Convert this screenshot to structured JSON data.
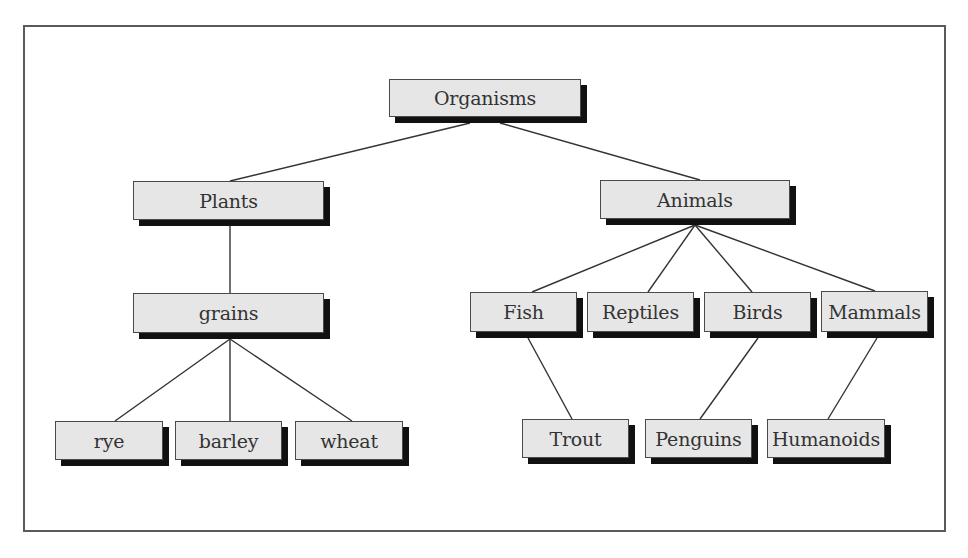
{
  "diagram": {
    "type": "tree",
    "colors": {
      "box_fill": "#e6e6e6",
      "box_border": "#4a4a4a",
      "shadow": "#111111",
      "edge": "#333333",
      "frame": "#5a5a5a"
    },
    "nodes": {
      "organisms": {
        "label": "Organisms",
        "x": 389,
        "y": 79,
        "w": 192,
        "h": 38
      },
      "plants": {
        "label": "Plants",
        "x": 133,
        "y": 181,
        "w": 191,
        "h": 39
      },
      "animals": {
        "label": "Animals",
        "x": 600,
        "y": 180,
        "w": 190,
        "h": 39
      },
      "grains": {
        "label": "grains",
        "x": 133,
        "y": 293,
        "w": 191,
        "h": 40
      },
      "fish": {
        "label": "Fish",
        "x": 470,
        "y": 292,
        "w": 107,
        "h": 40
      },
      "reptiles": {
        "label": "Reptiles",
        "x": 587,
        "y": 292,
        "w": 107,
        "h": 40
      },
      "birds": {
        "label": "Birds",
        "x": 704,
        "y": 292,
        "w": 107,
        "h": 40
      },
      "mammals": {
        "label": "Mammals",
        "x": 821,
        "y": 291,
        "w": 107,
        "h": 41
      },
      "rye": {
        "label": "rye",
        "x": 55,
        "y": 421,
        "w": 108,
        "h": 39
      },
      "barley": {
        "label": "barley",
        "x": 175,
        "y": 421,
        "w": 107,
        "h": 39
      },
      "wheat": {
        "label": "wheat",
        "x": 295,
        "y": 421,
        "w": 108,
        "h": 39
      },
      "trout": {
        "label": "Trout",
        "x": 522,
        "y": 419,
        "w": 107,
        "h": 39
      },
      "penguins": {
        "label": "Penguins",
        "x": 645,
        "y": 419,
        "w": 107,
        "h": 39
      },
      "humanoids": {
        "label": "Humanoids",
        "x": 767,
        "y": 419,
        "w": 118,
        "h": 39
      }
    },
    "edges": [
      {
        "from": "organisms",
        "to": "plants",
        "x1": 470,
        "y1": 123,
        "x2": 230,
        "y2": 181
      },
      {
        "from": "organisms",
        "to": "animals",
        "x1": 500,
        "y1": 123,
        "x2": 700,
        "y2": 180
      },
      {
        "from": "plants",
        "to": "grains",
        "x1": 230,
        "y1": 226,
        "x2": 230,
        "y2": 293
      },
      {
        "from": "grains",
        "to": "rye",
        "x1": 230,
        "y1": 339,
        "x2": 115,
        "y2": 421
      },
      {
        "from": "grains",
        "to": "barley",
        "x1": 230,
        "y1": 339,
        "x2": 230,
        "y2": 421
      },
      {
        "from": "grains",
        "to": "wheat",
        "x1": 230,
        "y1": 339,
        "x2": 352,
        "y2": 421
      },
      {
        "from": "animals",
        "to": "fish",
        "x1": 695,
        "y1": 225,
        "x2": 532,
        "y2": 292
      },
      {
        "from": "animals",
        "to": "reptiles",
        "x1": 695,
        "y1": 225,
        "x2": 648,
        "y2": 292
      },
      {
        "from": "animals",
        "to": "birds",
        "x1": 695,
        "y1": 225,
        "x2": 752,
        "y2": 292
      },
      {
        "from": "animals",
        "to": "mammals",
        "x1": 695,
        "y1": 225,
        "x2": 875,
        "y2": 291
      },
      {
        "from": "fish",
        "to": "trout",
        "x1": 528,
        "y1": 338,
        "x2": 572,
        "y2": 419
      },
      {
        "from": "birds",
        "to": "penguins",
        "x1": 758,
        "y1": 338,
        "x2": 700,
        "y2": 419
      },
      {
        "from": "mammals",
        "to": "humanoids",
        "x1": 877,
        "y1": 338,
        "x2": 828,
        "y2": 419
      }
    ]
  }
}
